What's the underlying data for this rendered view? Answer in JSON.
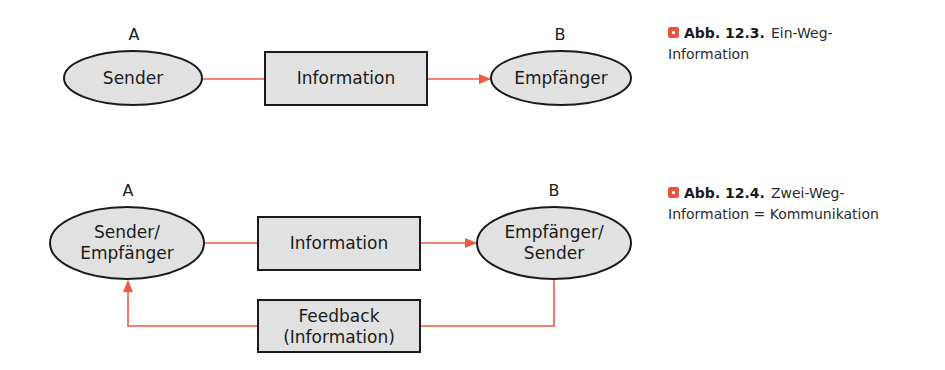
{
  "colors": {
    "node_fill": "#e2e2e2",
    "node_stroke": "#1a1a1a",
    "arrow": "#ef5a43",
    "caption_marker": "#e8553e"
  },
  "figure_12_3": {
    "label_a": "A",
    "label_b": "B",
    "sender": "Sender",
    "channel": "Information",
    "receiver": "Empfänger",
    "caption": {
      "number": "Abb. 12.3.",
      "text_line1": "Ein-Weg-",
      "text_line2": "Information"
    }
  },
  "figure_12_4": {
    "label_a": "A",
    "label_b": "B",
    "node_a_line1": "Sender/",
    "node_a_line2": "Empfänger",
    "channel": "Information",
    "node_b_line1": "Empfänger/",
    "node_b_line2": "Sender",
    "feedback_line1": "Feedback",
    "feedback_line2": "(Information)",
    "caption": {
      "number": "Abb. 12.4.",
      "text_line1": "Zwei-Weg-",
      "text_line2": "Information = Kommunikation"
    }
  }
}
